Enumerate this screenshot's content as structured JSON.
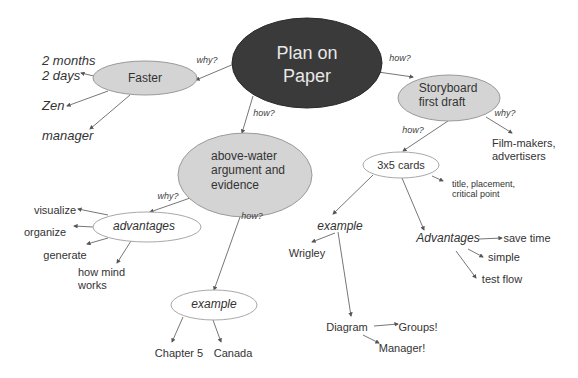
{
  "colors": {
    "root_fill": "#3a3a3a",
    "node_fill": "#d4d4d4",
    "node_stroke": "#9a9a9a",
    "open_node_stroke": "#a8a8a8",
    "line": "#555555",
    "text": "#333333"
  },
  "root": {
    "line1": "Plan on",
    "line2": "Paper"
  },
  "edges": {
    "root_faster": "why?",
    "root_storyboard": "how?",
    "root_abovewater": "how?",
    "storyboard_film": "why?",
    "storyboard_cards": "how?",
    "abovewater_advantages": "why?",
    "abovewater_example": "how?"
  },
  "faster": {
    "label": "Faster",
    "children": [
      "2 months",
      "2 days",
      "Zen",
      "manager"
    ]
  },
  "storyboard": {
    "line1": "Storyboard",
    "line2": "first draft",
    "film": {
      "line1": "Film-makers,",
      "line2": "advertisers"
    }
  },
  "cards": {
    "label": "3x5 cards",
    "detail": {
      "line1": "title, placement,",
      "line2": "critical point"
    },
    "example": {
      "label": "example",
      "wrigley": "Wrigley",
      "diagram": "Diagram",
      "groups": "Groups!",
      "manager": "Manager!"
    },
    "advantages": {
      "label": "Advantages",
      "items": [
        "save time",
        "simple",
        "test flow"
      ]
    }
  },
  "abovewater": {
    "line1": "above-water",
    "line2": "argument and",
    "line3": "evidence"
  },
  "advantages": {
    "label": "advantages",
    "items": [
      "visualize",
      "organize",
      "generate"
    ],
    "mind": {
      "line1": "how mind",
      "line2": "works"
    }
  },
  "example": {
    "label": "example",
    "items": [
      "Chapter 5",
      "Canada"
    ]
  }
}
